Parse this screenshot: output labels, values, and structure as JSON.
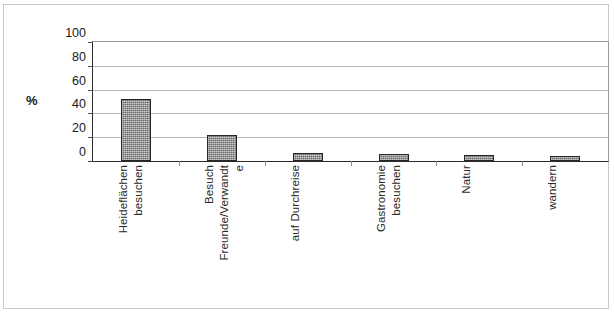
{
  "chart_data": {
    "type": "bar",
    "title": "",
    "subtitle": "",
    "xlabel": "",
    "ylabel": "%",
    "ylim": [
      0,
      100
    ],
    "y_ticks": [
      100,
      80,
      60,
      40,
      20,
      0
    ],
    "grid": true,
    "legend": "none",
    "categories": [
      "Heideflächen besuchen",
      "Besuch Freunde/Verwandte",
      "auf Durchreise",
      "Gastronomie besuchen",
      "Natur",
      "wandern"
    ],
    "category_lines": [
      [
        "Heideflächen",
        "besuchen"
      ],
      [
        "Besuch",
        "Freunde/Verwandt",
        "e"
      ],
      [
        "auf Durchreise"
      ],
      [
        "Gastronomie",
        "besuchen"
      ],
      [
        "Natur"
      ],
      [
        "wandern"
      ]
    ],
    "values": [
      52,
      22,
      7,
      6,
      5,
      4
    ],
    "bar_color": "#878787",
    "bar_border_color": "#262626",
    "axis_color": "#2b2b2b",
    "grid_color": "#b4b4b4"
  }
}
